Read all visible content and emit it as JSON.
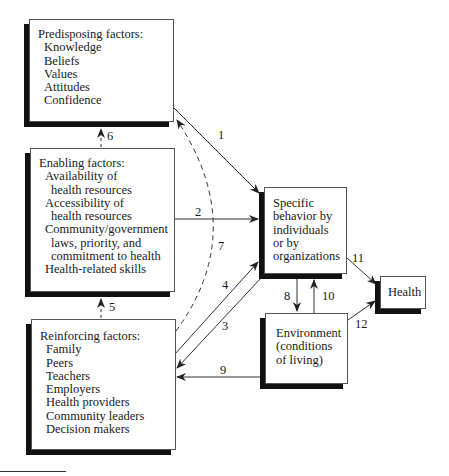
{
  "diagram": {
    "boxes": {
      "predisposing": {
        "title": "Predisposing factors:",
        "items": [
          "Knowledge",
          "Beliefs",
          "Values",
          "Attitudes",
          "Confidence"
        ]
      },
      "enabling": {
        "title": "Enabling factors:",
        "lines": [
          {
            "text": "Availability of",
            "indent": 1
          },
          {
            "text": "health resources",
            "indent": 2
          },
          {
            "text": "Accessibility of",
            "indent": 1
          },
          {
            "text": "health resources",
            "indent": 2
          },
          {
            "text": "Community/government",
            "indent": 1
          },
          {
            "text": "laws, priority, and",
            "indent": 2
          },
          {
            "text": "commitment to health",
            "indent": 2
          },
          {
            "text": "Health-related skills",
            "indent": 1
          }
        ]
      },
      "reinforcing": {
        "title": "Reinforcing factors:",
        "items": [
          "Family",
          "Peers",
          "Teachers",
          "Employers",
          "Health providers",
          "Community leaders",
          "Decision makers"
        ]
      },
      "behavior": {
        "lines": [
          "Specific",
          "behavior by",
          "individuals",
          "or by",
          "organizations"
        ]
      },
      "environment": {
        "lines": [
          "Environment",
          "(conditions",
          "of living)"
        ]
      },
      "health": {
        "label": "Health"
      }
    },
    "arrows": [
      {
        "id": "1",
        "from": "predisposing",
        "to": "behavior",
        "style": "solid"
      },
      {
        "id": "2",
        "from": "enabling",
        "to": "behavior",
        "style": "solid"
      },
      {
        "id": "3",
        "from": "behavior",
        "to": "reinforcing",
        "style": "solid"
      },
      {
        "id": "4",
        "from": "reinforcing",
        "to": "behavior",
        "style": "solid"
      },
      {
        "id": "5",
        "from": "reinforcing",
        "to": "enabling",
        "style": "dashed"
      },
      {
        "id": "6",
        "from": "enabling",
        "to": "predisposing",
        "style": "dashed"
      },
      {
        "id": "7",
        "from": "reinforcing",
        "to": "predisposing",
        "style": "dashed"
      },
      {
        "id": "8",
        "from": "behavior",
        "to": "environment",
        "style": "solid"
      },
      {
        "id": "9",
        "from": "environment",
        "to": "reinforcing",
        "style": "solid"
      },
      {
        "id": "10",
        "from": "environment",
        "to": "behavior",
        "style": "solid"
      },
      {
        "id": "11",
        "from": "behavior",
        "to": "health",
        "style": "solid"
      },
      {
        "id": "12",
        "from": "environment",
        "to": "health",
        "style": "solid"
      }
    ]
  }
}
